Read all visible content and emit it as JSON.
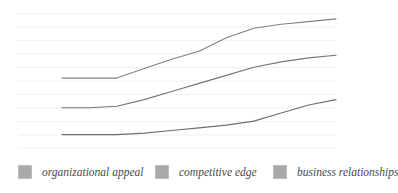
{
  "chart_data": {
    "type": "line",
    "title": "",
    "subtitle": "",
    "xlabel": "",
    "ylabel": "",
    "grid": true,
    "gridlines": 11,
    "legend_position": "bottom",
    "xlim": [
      0,
      10
    ],
    "ylim": [
      0,
      10
    ],
    "x": [
      0,
      1,
      2,
      3,
      4,
      5,
      6,
      7,
      8,
      9,
      10
    ],
    "series": [
      {
        "name": "organizational appeal",
        "color": "#808080",
        "values": [
          5.2,
          5.2,
          5.2,
          5.9,
          6.6,
          7.2,
          8.2,
          8.9,
          9.2,
          9.4,
          9.6
        ]
      },
      {
        "name": "competitive edge",
        "color": "#767676",
        "values": [
          3.0,
          3.0,
          3.1,
          3.6,
          4.2,
          4.8,
          5.4,
          6.0,
          6.4,
          6.7,
          6.9
        ]
      },
      {
        "name": "business relationships",
        "color": "#6e6e6e",
        "values": [
          1.0,
          1.0,
          1.0,
          1.1,
          1.3,
          1.5,
          1.7,
          2.0,
          2.6,
          3.2,
          3.6
        ]
      }
    ]
  },
  "legend": {
    "items": [
      {
        "label": "organizational appeal",
        "color": "#a9a9a9"
      },
      {
        "label": "competitive edge",
        "color": "#a9a9a9"
      },
      {
        "label": "business relationships",
        "color": "#a9a9a9"
      }
    ]
  },
  "colors": {
    "background": "#ffffff",
    "gridline": "#f2f2f2",
    "swatch": "#a9a9a9",
    "legend_text": "#4a4a4a",
    "series_top": "#808080",
    "series_middle": "#767676",
    "series_bottom": "#6e6e6e"
  }
}
